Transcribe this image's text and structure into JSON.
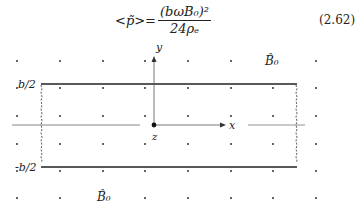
{
  "equation": {
    "lhs": "<p̃>=",
    "numerator": "(bωB₀)²",
    "denominator": "24ρₑ",
    "number": "(2.62)"
  },
  "diagram": {
    "axis_labels": {
      "y": "y",
      "x": "x",
      "z": "z"
    },
    "plate_labels": {
      "top": "b/2",
      "bottom": "-b/2"
    },
    "field_labels": [
      "B̂₀",
      "B̂₀"
    ],
    "colors": {
      "ink": "#222222",
      "grid_dots": "#333333",
      "axis": "#555555"
    },
    "dot_grid": {
      "columns_x": [
        17,
        60,
        103,
        145,
        188,
        231,
        273,
        316
      ],
      "rows_y": [
        61,
        88,
        116,
        144,
        171,
        198
      ]
    }
  }
}
